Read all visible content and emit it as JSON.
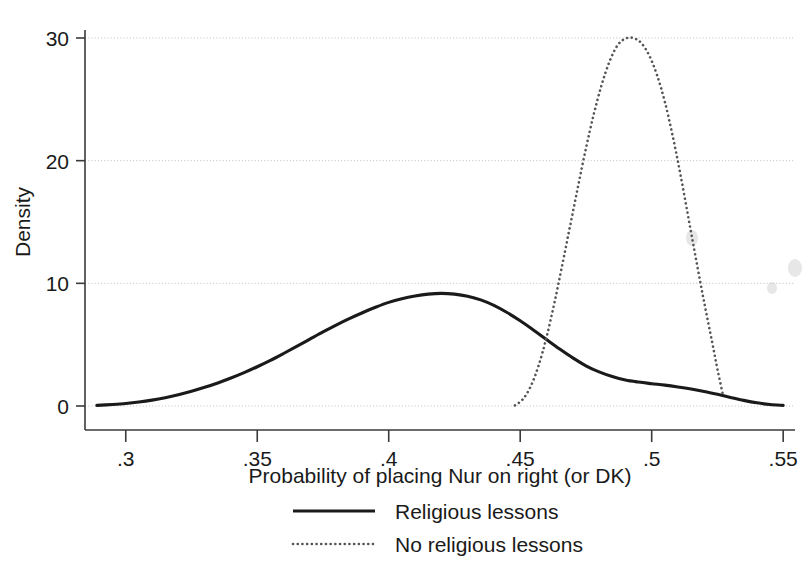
{
  "chart_data": {
    "type": "line",
    "title": "",
    "subtitle": "",
    "xlabel": "Probability of placing Nur on right (or DK)",
    "ylabel": "Density",
    "xlim": [
      0.2845,
      0.5545
    ],
    "ylim": [
      0,
      31.5
    ],
    "grid": true,
    "grid_axis": "y",
    "legend_position": "bottom-center",
    "xticks": [
      0.3,
      0.35,
      0.4,
      0.45,
      0.5,
      0.55
    ],
    "xtick_labels": [
      ".3",
      ".35",
      ".4",
      ".45",
      ".5",
      ".55"
    ],
    "yticks": [
      0,
      10,
      20,
      30
    ],
    "ytick_labels": [
      "0",
      "10",
      "20",
      "30"
    ],
    "series": [
      {
        "name": "Religious lessons",
        "style": "solid",
        "color": "#1a1a1a",
        "x": [
          0.289,
          0.295,
          0.3,
          0.305,
          0.31,
          0.315,
          0.32,
          0.325,
          0.33,
          0.335,
          0.34,
          0.345,
          0.35,
          0.355,
          0.36,
          0.365,
          0.37,
          0.375,
          0.38,
          0.385,
          0.39,
          0.395,
          0.4,
          0.405,
          0.41,
          0.415,
          0.42,
          0.425,
          0.43,
          0.435,
          0.44,
          0.445,
          0.45,
          0.455,
          0.46,
          0.465,
          0.47,
          0.475,
          0.48,
          0.485,
          0.49,
          0.495,
          0.5,
          0.505,
          0.51,
          0.515,
          0.52,
          0.525,
          0.53,
          0.535,
          0.54,
          0.545,
          0.55
        ],
        "y": [
          0.05,
          0.12,
          0.2,
          0.32,
          0.48,
          0.68,
          0.92,
          1.2,
          1.52,
          1.88,
          2.28,
          2.72,
          3.2,
          3.72,
          4.28,
          4.86,
          5.45,
          6.04,
          6.6,
          7.12,
          7.6,
          8.05,
          8.45,
          8.75,
          8.97,
          9.12,
          9.18,
          9.12,
          8.95,
          8.65,
          8.2,
          7.62,
          6.95,
          6.2,
          5.42,
          4.65,
          3.92,
          3.28,
          2.78,
          2.4,
          2.12,
          1.95,
          1.82,
          1.7,
          1.55,
          1.38,
          1.18,
          0.95,
          0.7,
          0.46,
          0.26,
          0.12,
          0.05
        ]
      },
      {
        "name": "No religious lessons",
        "style": "dotted",
        "color": "#555555",
        "x": [
          0.448,
          0.451,
          0.454,
          0.457,
          0.46,
          0.463,
          0.466,
          0.469,
          0.472,
          0.475,
          0.478,
          0.481,
          0.484,
          0.487,
          0.49,
          0.493,
          0.496,
          0.499,
          0.502,
          0.505,
          0.508,
          0.511,
          0.514,
          0.517,
          0.52,
          0.523,
          0.525,
          0.527
        ],
        "y": [
          0.05,
          0.55,
          1.6,
          3.3,
          5.6,
          8.4,
          11.5,
          14.7,
          17.9,
          21.0,
          23.8,
          26.2,
          28.1,
          29.4,
          29.95,
          30.0,
          29.6,
          28.6,
          27.0,
          24.8,
          22.0,
          18.8,
          15.3,
          11.8,
          8.4,
          5.2,
          3.0,
          1.0
        ]
      }
    ]
  },
  "legend": {
    "items": [
      {
        "label": "Religious lessons",
        "style": "solid"
      },
      {
        "label": "No religious lessons",
        "style": "dotted"
      }
    ]
  }
}
